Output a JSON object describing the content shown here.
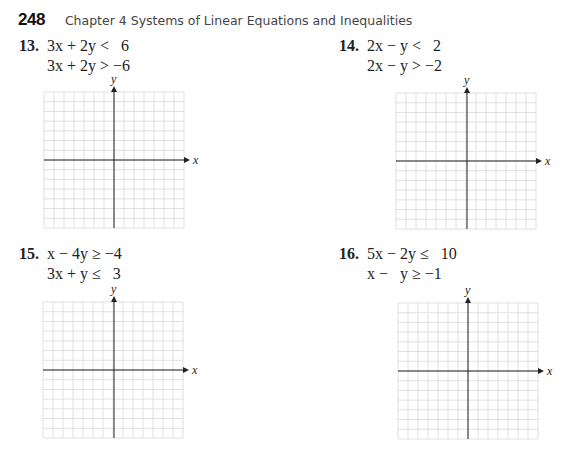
{
  "header": {
    "page_number": "248",
    "chapter_title": "Chapter 4  Systems of Linear Equations and Inequalities"
  },
  "problems": [
    {
      "number": "13.",
      "line1": "3x + 2y <   6",
      "line2": "3x + 2y > −6",
      "graph": {
        "x_label": "x",
        "y_label": "y",
        "grid_cells": 14
      }
    },
    {
      "number": "14.",
      "line1": "2x − y <   2",
      "line2": "2x − y > −2",
      "graph": {
        "x_label": "x",
        "y_label": "y",
        "grid_cells": 14
      }
    },
    {
      "number": "15.",
      "line1": "x − 4y ≥ −4",
      "line2": "3x + y ≤   3",
      "graph": {
        "x_label": "x",
        "y_label": "y",
        "grid_cells": 14
      }
    },
    {
      "number": "16.",
      "line1": "5x − 2y ≤   10",
      "line2": "x −   y ≥ −1",
      "graph": {
        "x_label": "x",
        "y_label": "y",
        "grid_cells": 14
      }
    }
  ],
  "colors": {
    "grid_line": "#d8d8d8",
    "axis": "#222222",
    "text": "#222222"
  }
}
